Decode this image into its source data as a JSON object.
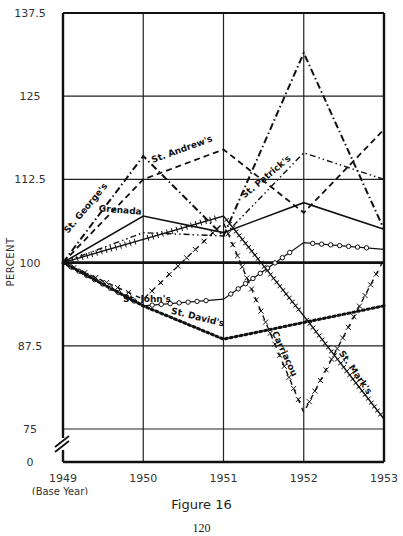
{
  "figure": {
    "caption": "Figure 16",
    "page_number": "120"
  },
  "chart_data": {
    "type": "line",
    "title": "",
    "xlabel": "",
    "ylabel": "PERCENT",
    "x": [
      1949,
      1950,
      1951,
      1952,
      1953
    ],
    "x_tick_labels": [
      "1949",
      "1950",
      "1951",
      "1952",
      "1953"
    ],
    "x_sub_label": "(Base Year)",
    "y_tick_labels": [
      "137.5",
      "125",
      "112.5",
      "100",
      "87.5",
      "75",
      "0"
    ],
    "ylim": [
      75,
      137.5
    ],
    "axis_break": "between 0 and 75",
    "grid": true,
    "legend_position": "inline labels",
    "series": [
      {
        "name": "Grenada",
        "style": "solid",
        "values": [
          100,
          107,
          104.5,
          109,
          105
        ]
      },
      {
        "name": "St. George's",
        "style": "dash-dot",
        "values": [
          100,
          116,
          104,
          131.5,
          105
        ]
      },
      {
        "name": "St. Andrew's",
        "style": "dashed",
        "values": [
          100,
          112.5,
          117,
          107.5,
          120
        ]
      },
      {
        "name": "St. Patrick's",
        "style": "dash-dot-dot",
        "values": [
          100,
          104.5,
          104,
          116.5,
          112.5
        ]
      },
      {
        "name": "St. John's",
        "style": "circles",
        "values": [
          100,
          93.5,
          94.5,
          103,
          102
        ]
      },
      {
        "name": "St. David's",
        "style": "dotted",
        "values": [
          100,
          93.5,
          88.5,
          91,
          93.5
        ]
      },
      {
        "name": "Carriacou",
        "style": "x-dashed",
        "values": [
          100,
          94.5,
          106,
          77.5,
          100.5
        ]
      },
      {
        "name": "St. Mark's",
        "style": "hatched",
        "values": [
          100,
          103.5,
          107,
          92,
          76.5
        ]
      }
    ],
    "reference_line": {
      "value": 100,
      "style": "bold"
    }
  }
}
